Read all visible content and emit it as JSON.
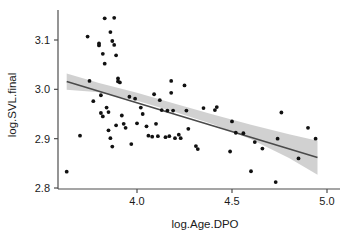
{
  "chart_data": {
    "type": "scatter",
    "title": "",
    "subtitle": "",
    "xlabel": "log.Age.DPO",
    "ylabel": "log.SVL.final",
    "xlim": [
      3.58,
      5.02
    ],
    "ylim": [
      2.79,
      3.16
    ],
    "xticks": [
      4.0,
      4.5,
      5.0
    ],
    "xticklabels": [
      "4.0",
      "4.5",
      "5.0"
    ],
    "yticks": [
      2.8,
      2.9,
      3.0,
      3.1
    ],
    "yticklabels": [
      "2.8",
      "2.9",
      "3.0",
      "3.1"
    ],
    "grid": false,
    "legend": null,
    "point_color": "#111111",
    "line_color": "#4a4a4a",
    "band_color": "#c9c9c9",
    "axis_color": "#4d4d4d",
    "background": "#ffffff",
    "points": [
      {
        "x": 3.63,
        "y": 2.833
      },
      {
        "x": 3.7,
        "y": 2.906
      },
      {
        "x": 3.74,
        "y": 3.107
      },
      {
        "x": 3.75,
        "y": 3.017
      },
      {
        "x": 3.77,
        "y": 2.976
      },
      {
        "x": 3.8,
        "y": 3.089
      },
      {
        "x": 3.8,
        "y": 3.093
      },
      {
        "x": 3.81,
        "y": 2.988
      },
      {
        "x": 3.81,
        "y": 2.952
      },
      {
        "x": 3.82,
        "y": 2.945
      },
      {
        "x": 3.82,
        "y": 3.072
      },
      {
        "x": 3.83,
        "y": 3.144
      },
      {
        "x": 3.83,
        "y": 3.052
      },
      {
        "x": 3.84,
        "y": 2.963
      },
      {
        "x": 3.85,
        "y": 2.917
      },
      {
        "x": 3.85,
        "y": 2.954
      },
      {
        "x": 3.86,
        "y": 2.901
      },
      {
        "x": 3.86,
        "y": 3.116
      },
      {
        "x": 3.87,
        "y": 2.884
      },
      {
        "x": 3.87,
        "y": 3.098
      },
      {
        "x": 3.88,
        "y": 3.145
      },
      {
        "x": 3.88,
        "y": 3.09
      },
      {
        "x": 3.89,
        "y": 2.927
      },
      {
        "x": 3.89,
        "y": 3.069
      },
      {
        "x": 3.9,
        "y": 3.022
      },
      {
        "x": 3.9,
        "y": 3.016
      },
      {
        "x": 3.91,
        "y": 3.014
      },
      {
        "x": 3.92,
        "y": 2.947
      },
      {
        "x": 3.93,
        "y": 2.93
      },
      {
        "x": 3.94,
        "y": 2.922
      },
      {
        "x": 3.96,
        "y": 2.985
      },
      {
        "x": 3.97,
        "y": 2.889
      },
      {
        "x": 3.99,
        "y": 2.981
      },
      {
        "x": 4.0,
        "y": 2.931
      },
      {
        "x": 4.02,
        "y": 2.963
      },
      {
        "x": 4.03,
        "y": 2.95
      },
      {
        "x": 4.05,
        "y": 2.925
      },
      {
        "x": 4.06,
        "y": 2.906
      },
      {
        "x": 4.08,
        "y": 2.904
      },
      {
        "x": 4.09,
        "y": 2.99
      },
      {
        "x": 4.1,
        "y": 2.93
      },
      {
        "x": 4.11,
        "y": 2.905
      },
      {
        "x": 4.12,
        "y": 2.978
      },
      {
        "x": 4.13,
        "y": 2.958
      },
      {
        "x": 4.15,
        "y": 2.903
      },
      {
        "x": 4.16,
        "y": 2.957
      },
      {
        "x": 4.17,
        "y": 2.905
      },
      {
        "x": 4.18,
        "y": 3.017
      },
      {
        "x": 4.18,
        "y": 2.993
      },
      {
        "x": 4.19,
        "y": 2.957
      },
      {
        "x": 4.2,
        "y": 2.901
      },
      {
        "x": 4.22,
        "y": 2.908
      },
      {
        "x": 4.23,
        "y": 2.901
      },
      {
        "x": 4.25,
        "y": 3.008
      },
      {
        "x": 4.26,
        "y": 2.957
      },
      {
        "x": 4.27,
        "y": 2.92
      },
      {
        "x": 4.31,
        "y": 2.885
      },
      {
        "x": 4.32,
        "y": 2.879
      },
      {
        "x": 4.35,
        "y": 2.962
      },
      {
        "x": 4.41,
        "y": 2.958
      },
      {
        "x": 4.42,
        "y": 2.964
      },
      {
        "x": 4.49,
        "y": 2.874
      },
      {
        "x": 4.5,
        "y": 2.935
      },
      {
        "x": 4.52,
        "y": 2.912
      },
      {
        "x": 4.56,
        "y": 2.911
      },
      {
        "x": 4.6,
        "y": 2.834
      },
      {
        "x": 4.62,
        "y": 2.893
      },
      {
        "x": 4.66,
        "y": 2.88
      },
      {
        "x": 4.73,
        "y": 2.812
      },
      {
        "x": 4.74,
        "y": 2.9
      },
      {
        "x": 4.76,
        "y": 2.953
      },
      {
        "x": 4.85,
        "y": 2.86
      },
      {
        "x": 4.9,
        "y": 2.922
      },
      {
        "x": 4.94,
        "y": 2.9
      }
    ],
    "fit_line": {
      "x_start": 3.63,
      "y_start": 3.016,
      "x_end": 4.95,
      "y_end": 2.862,
      "slope": -0.1167,
      "intercept": 3.4397
    },
    "confidence_band": {
      "level": 0.95,
      "upper": [
        {
          "x": 3.63,
          "y": 3.032
        },
        {
          "x": 3.8,
          "y": 3.013
        },
        {
          "x": 4.0,
          "y": 2.993
        },
        {
          "x": 4.2,
          "y": 2.971
        },
        {
          "x": 4.4,
          "y": 2.949
        },
        {
          "x": 4.6,
          "y": 2.928
        },
        {
          "x": 4.8,
          "y": 2.909
        },
        {
          "x": 4.95,
          "y": 2.896
        }
      ],
      "lower": [
        {
          "x": 3.63,
          "y": 2.999
        },
        {
          "x": 3.8,
          "y": 2.994
        },
        {
          "x": 4.0,
          "y": 2.977
        },
        {
          "x": 4.2,
          "y": 2.954
        },
        {
          "x": 4.4,
          "y": 2.929
        },
        {
          "x": 4.6,
          "y": 2.899
        },
        {
          "x": 4.8,
          "y": 2.861
        },
        {
          "x": 4.95,
          "y": 2.827
        }
      ]
    }
  }
}
